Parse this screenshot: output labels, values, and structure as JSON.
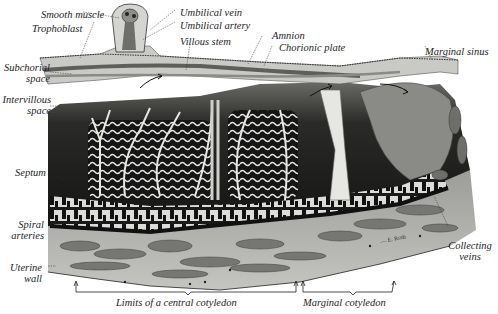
{
  "figure": {
    "palette": {
      "background": "#ffffff",
      "ink": "#1e1e1e",
      "intervillous_dark": "#141414",
      "villus_light": "#e6e6e2",
      "chorionic_plate": "#c9c9c5",
      "uterine_wall": "#b4b4b0",
      "vessel_gray": "#7c7c78",
      "marginal_sinus": "#8a8a86"
    },
    "signature": "— E. Roth"
  },
  "labels": {
    "smooth_muscle": "Smooth muscle",
    "trophoblast": "Trophoblast",
    "umbilical_vein": "Umbilical vein",
    "umbilical_artery": "Umbilical artery",
    "villous_stem": "Villous stem",
    "amnion": "Amnion",
    "chorionic_plate": "Chorionic plate",
    "marginal_sinus": "Marginal sinus",
    "subchorial_space_1": "Subchorial",
    "subchorial_space_2": "space",
    "intervillous_space_1": "Intervillous",
    "intervillous_space_2": "space",
    "septum": "Septum",
    "spiral_arteries_1": "Spiral",
    "spiral_arteries_2": "arteries",
    "uterine_wall_1": "Uterine",
    "uterine_wall_2": "wall",
    "collecting_veins_1": "Collecting",
    "collecting_veins_2": "veins",
    "central_cotyledon": "Limits of a central cotyledon",
    "marginal_cotyledon": "Marginal cotyledon"
  }
}
